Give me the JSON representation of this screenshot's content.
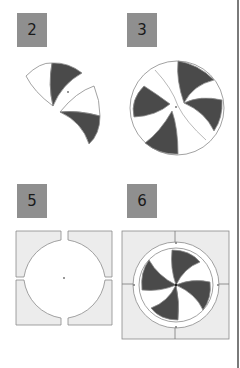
{
  "panels": [
    {
      "label": "2",
      "description": "two wing segments arranged around center"
    },
    {
      "label": "3",
      "description": "circle composed of six curved wing segments"
    },
    {
      "label": "5",
      "description": "square frame with circular cut-out split into four quarters"
    },
    {
      "label": "6",
      "description": "assembled pinwheel inside ring and square frame"
    }
  ],
  "colors": {
    "badge": "#8f8f8f",
    "dark_fill": "#4a4a4a",
    "outline": "#8a8a8a",
    "frame_fill": "#ececec",
    "divider": "#7a7a7a"
  }
}
